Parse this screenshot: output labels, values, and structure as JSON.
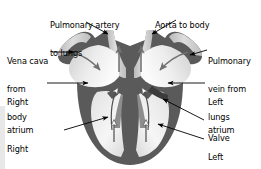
{
  "diagram": {
    "colors": {
      "wall": "#5a5a5a",
      "wall_light": "#8d8d8d",
      "chamber_light": "#f4f4f4",
      "chamber_mid": "#d9d9d9",
      "vessel_fill": "#c9c9c9",
      "arrow_flow": "#6f6f6f",
      "arrow_flow_open": "#ffffff",
      "label_text": "#000000",
      "leader": "#000000",
      "background": "#ffffff",
      "edge_strip": "#e8e8e8"
    }
  },
  "labels": {
    "pulmonary_artery": {
      "lines": [
        "Pulmonary artery",
        "to lungs"
      ],
      "line1": "Pulmonary artery",
      "line2": "to lungs",
      "align": "left"
    },
    "aorta": {
      "lines": [
        "Aorta to body"
      ],
      "line1": "Aorta to body",
      "align": "left"
    },
    "vena_cava": {
      "lines": [
        "Vena cava",
        "from",
        "body"
      ],
      "line1": "Vena cava",
      "line2": "from",
      "line3": "body",
      "align": "left"
    },
    "right_atrium": {
      "lines": [
        "Right",
        "atrium"
      ],
      "line1": "Right",
      "line2": "atrium",
      "align": "left"
    },
    "right_ventricle": {
      "lines": [
        "Right",
        "ventricle"
      ],
      "line1": "Right",
      "line2": "ventricle",
      "align": "left"
    },
    "pulmonary_vein": {
      "lines": [
        "Pulmonary",
        "vein from",
        "lungs"
      ],
      "line1": "Pulmonary",
      "line2": "vein from",
      "line3": "lungs",
      "align": "left"
    },
    "left_atrium": {
      "lines": [
        "Left",
        "atrium"
      ],
      "line1": "Left",
      "line2": "atrium",
      "align": "left"
    },
    "valve": {
      "lines": [
        "Valve"
      ],
      "line1": "Valve",
      "align": "left"
    },
    "left_ventricle": {
      "lines": [
        "Left",
        "ventricle"
      ],
      "line1": "Left",
      "line2": "ventricle",
      "align": "left"
    }
  }
}
